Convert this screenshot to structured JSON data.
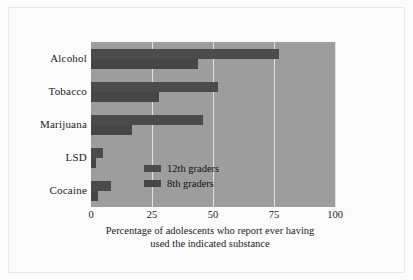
{
  "chart_data": {
    "type": "bar",
    "orientation": "horizontal",
    "categories": [
      "Alcohol",
      "Tobacco",
      "Marijuana",
      "LSD",
      "Cocaine"
    ],
    "series": [
      {
        "name": "12th graders",
        "values": [
          77,
          52,
          46,
          5,
          8
        ]
      },
      {
        "name": "8th graders",
        "values": [
          44,
          28,
          17,
          2,
          3
        ]
      }
    ],
    "title": "",
    "xlabel": "Percentage of adolescents who report ever having used the indicated substance",
    "ylabel": "",
    "xlim": [
      0,
      100
    ],
    "xticks": [
      "0",
      "25",
      "50",
      "75",
      "100"
    ],
    "xtick_values": [
      0,
      25,
      50,
      75,
      100
    ],
    "grid": true,
    "legend_position": "inside-center",
    "colors": {
      "bar_12th": "#4b4b4b",
      "bar_8th": "#464646",
      "plot_background": "#9d9d9d",
      "gridline": "#e2e2e2",
      "text": "#1c1c1c",
      "page_background": "#fbfbfb"
    }
  },
  "caption": {
    "line1": "Percentage of adolescents who report ever having",
    "line2": "used the indicated substance"
  },
  "legend": {
    "items": [
      {
        "label": "12th graders"
      },
      {
        "label": "8th graders"
      }
    ]
  }
}
